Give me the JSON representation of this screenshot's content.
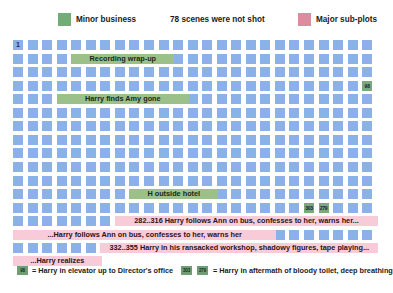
{
  "legend_top": {
    "minor_swatch_color": "#74ac77",
    "minor_label": "Minor business",
    "center_label": "78 scenes were not shot",
    "major_swatch_color": "#dd8ca0",
    "major_label": "Major sub-plots"
  },
  "grid": {
    "columns": 25,
    "rows": 16,
    "cell_color": "#8cb0e8",
    "green_cell_color": "#7ba87e",
    "first_cell_label": "1",
    "numbered_cells": [
      {
        "row": 3,
        "col": 24,
        "label": "98",
        "kind": "green"
      },
      {
        "row": 12,
        "col": 20,
        "label": "303",
        "kind": "green"
      },
      {
        "row": 12,
        "col": 21,
        "label": "279",
        "kind": "green"
      },
      {
        "row": 15,
        "col": 23,
        "label": "387",
        "kind": "blue"
      }
    ]
  },
  "bands": [
    {
      "row": 1,
      "start_col": 4,
      "end_col": 11,
      "kind": "green",
      "align": "center",
      "label": "Recording wrap-up"
    },
    {
      "row": 4,
      "start_col": 3,
      "end_col": 12,
      "kind": "green",
      "align": "center",
      "label": "Harry finds Amy gone"
    },
    {
      "row": 11,
      "start_col": 8,
      "end_col": 14,
      "kind": "green",
      "align": "center",
      "label": "H outside hotel"
    },
    {
      "row": 13,
      "start_col": 7,
      "end_col": 25,
      "kind": "pink",
      "align": "center",
      "label": "282..316 Harry follows Ann on bus, confesses to her, warns her..."
    },
    {
      "row": 14,
      "start_col": 0,
      "end_col": 18,
      "kind": "pink",
      "align": "center",
      "label": "...Harry follows Ann on bus, confesses to her, warns her"
    },
    {
      "row": 14.98,
      "start_col": 6,
      "end_col": 25,
      "kind": "pink",
      "align": "center",
      "label": "332..355 Harry in his ransacked workshop, shadowy figures, tape playing..."
    },
    {
      "row": 15.95,
      "start_col": 0,
      "end_col": 6,
      "kind": "pink",
      "align": "center",
      "label": "...Harry realizes"
    }
  ],
  "legend_bottom": {
    "entry_a": {
      "swatch_color": "#6f9e74",
      "swatch_label": "98",
      "text": "= Harry in elevator up to Director's office"
    },
    "entry_b": {
      "swatch_color": "#6f9e74",
      "swatch_label_1": "303",
      "swatch_label_2": "279",
      "text": "= Harry in aftermath of bloody toilet, deep breathing"
    }
  }
}
